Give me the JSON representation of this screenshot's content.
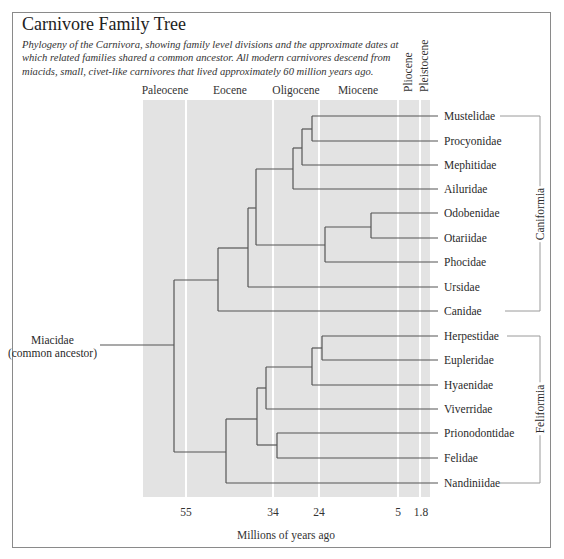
{
  "title": "Carnivore Family Tree",
  "subtitle": "Phylogeny of the Carnivora, showing family level divisions and the approximate dates at which related families shared a common ancestor. All modern carnivores descend from miacids, small, civet-like carnivores that lived approximately 60 million years ago.",
  "epochs": {
    "paleocene": "Paleocene",
    "eocene": "Eocene",
    "oligocene": "Oligocene",
    "miocene": "Miocene",
    "pliocene": "Pliocene",
    "pleistocene": "Pleistocene"
  },
  "ancestor": {
    "name": "Miacidae",
    "note": "(common ancestor)"
  },
  "groups": {
    "caniformia": "Caniformia",
    "feliformia": "Feliformia"
  },
  "families": {
    "caniformia": [
      "Mustelidae",
      "Procyonidae",
      "Mephitidae",
      "Ailuridae",
      "Odobenidae",
      "Otariidae",
      "Phocidae",
      "Ursidae",
      "Canidae"
    ],
    "feliformia": [
      "Herpestidae",
      "Eupleridae",
      "Hyaenidae",
      "Viverridae",
      "Prionodontidae",
      "Felidae",
      "Nandiniidae"
    ]
  },
  "axis": {
    "title": "Millions of years ago",
    "ticks": [
      "55",
      "34",
      "24",
      "5",
      "1.8"
    ]
  },
  "colors": {
    "timeline_band": "#e3e3e3",
    "divider": "#ffffff",
    "branch": "#555555",
    "bracket": "#9a9a9a"
  }
}
